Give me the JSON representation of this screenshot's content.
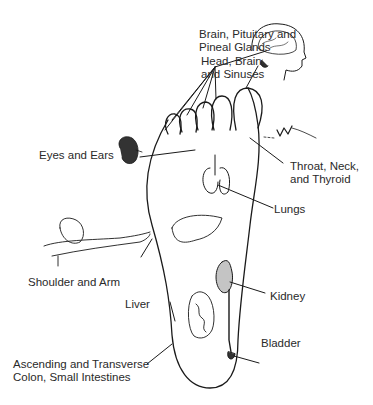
{
  "diagram": {
    "labels": {
      "brain": [
        "Brain, Pituitary and",
        "Pineal Glands"
      ],
      "head": [
        "Head, Brain,",
        "and Sinuses"
      ],
      "eyes": "Eyes and Ears",
      "throat": [
        "Throat, Neck,",
        "and Thyroid"
      ],
      "lungs": "Lungs",
      "shoulder": "Shoulder and Arm",
      "liver": "Liver",
      "kidney": "Kidney",
      "bladder": "Bladder",
      "colon": [
        "Ascending and Transverse",
        "Colon, Small Intestines"
      ]
    },
    "colors": {
      "line": "#1a1a1a",
      "text": "#2a2a2a",
      "background": "#ffffff"
    }
  }
}
